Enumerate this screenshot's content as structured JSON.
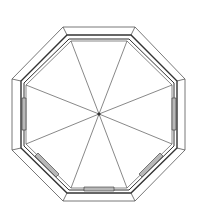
{
  "diagram": {
    "type": "octagonal-gazebo-roof-plan",
    "stroke_color": "#333333",
    "thin_stroke_color": "#555555",
    "panel_fill": "#b8b8b8",
    "background": "#ffffff",
    "center": [
      99,
      114
    ],
    "outer_octagon": [
      [
        63,
        27
      ],
      [
        135,
        27
      ],
      [
        185,
        79
      ],
      [
        185,
        150
      ],
      [
        135,
        201
      ],
      [
        63,
        201
      ],
      [
        12,
        150
      ],
      [
        12,
        79
      ]
    ],
    "rim_octagon": [
      [
        67,
        35
      ],
      [
        131,
        35
      ],
      [
        177,
        81
      ],
      [
        177,
        148
      ],
      [
        131,
        193
      ],
      [
        67,
        193
      ],
      [
        21,
        148
      ],
      [
        21,
        81
      ]
    ],
    "inner_octagon": [
      [
        69,
        39
      ],
      [
        129,
        39
      ],
      [
        174,
        83
      ],
      [
        174,
        146
      ],
      [
        129,
        190
      ],
      [
        69,
        190
      ],
      [
        24,
        146
      ],
      [
        24,
        83
      ]
    ],
    "innermost_octagon": [
      [
        71,
        41
      ],
      [
        127,
        41
      ],
      [
        172,
        85
      ],
      [
        172,
        144
      ],
      [
        127,
        188
      ],
      [
        71,
        188
      ],
      [
        26,
        144
      ],
      [
        26,
        85
      ]
    ],
    "window_panels": [
      {
        "name": "west",
        "points": [
          [
            22,
            98
          ],
          [
            26,
            98
          ],
          [
            26,
            130
          ],
          [
            22,
            130
          ]
        ]
      },
      {
        "name": "east",
        "points": [
          [
            172,
            98
          ],
          [
            176,
            98
          ],
          [
            176,
            130
          ],
          [
            172,
            130
          ]
        ]
      },
      {
        "name": "south",
        "points": [
          [
            84,
            187
          ],
          [
            114,
            187
          ],
          [
            114,
            191
          ],
          [
            84,
            191
          ]
        ]
      },
      {
        "name": "south-west",
        "points": [
          [
            35,
            156
          ],
          [
            38,
            153
          ],
          [
            59,
            174
          ],
          [
            56,
            177
          ]
        ]
      },
      {
        "name": "south-east",
        "points": [
          [
            160,
            153
          ],
          [
            163,
            156
          ],
          [
            142,
            177
          ],
          [
            139,
            174
          ]
        ]
      }
    ]
  }
}
